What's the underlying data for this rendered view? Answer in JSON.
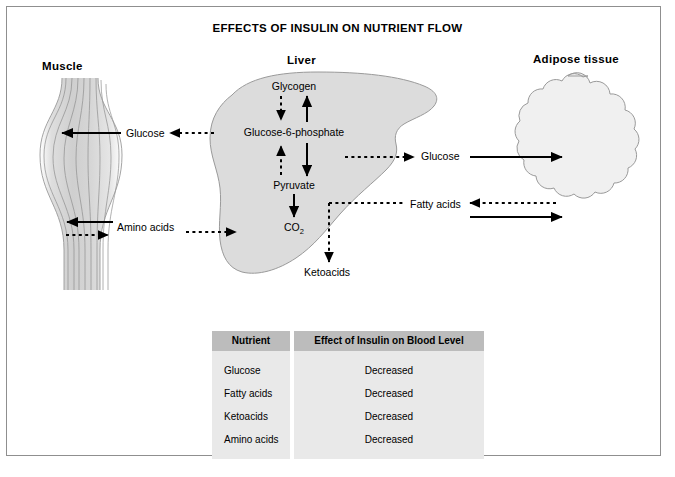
{
  "figure": {
    "title": "EFFECTS OF INSULIN ON NUTRIENT FLOW"
  },
  "organs": {
    "muscle": {
      "title": "Muscle",
      "icon": "muscle-fiber-shape"
    },
    "liver": {
      "title": "Liver",
      "icon": "liver-lobe-shape"
    },
    "adipose": {
      "title": "Adipose tissue",
      "icon": "adipocyte-cluster-shape"
    }
  },
  "liver_pathway": {
    "nodes": {
      "glycogen": "Glycogen",
      "glucose_6_phosphate": "Glucose-6-phosphate",
      "pyruvate": "Pyruvate",
      "co2_main": "CO",
      "co2_sub": "2",
      "ketoacids": "Ketoacids"
    },
    "steps": [
      {
        "from": "Glycogen",
        "to": "Glucose-6-phosphate",
        "style": "dashed",
        "direction": "down",
        "meaning": "glycogenolysis-inhibited"
      },
      {
        "from": "Glucose-6-phosphate",
        "to": "Glycogen",
        "style": "solid",
        "direction": "up",
        "meaning": "glycogenesis-stimulated"
      },
      {
        "from": "Pyruvate",
        "to": "Glucose-6-phosphate",
        "style": "dashed",
        "direction": "up",
        "meaning": "gluconeogenesis-inhibited"
      },
      {
        "from": "Glucose-6-phosphate",
        "to": "Pyruvate",
        "style": "solid",
        "direction": "down",
        "meaning": "glycolysis-stimulated"
      },
      {
        "from": "Pyruvate",
        "to": "CO2",
        "style": "solid",
        "direction": "down",
        "meaning": "oxidation-stimulated"
      },
      {
        "from": "Fatty acids",
        "to": "Ketoacids",
        "style": "dashed",
        "direction": "down",
        "meaning": "ketogenesis-inhibited"
      }
    ]
  },
  "transport_labels": {
    "glucose_muscle": "Glucose",
    "amino_acids": "Amino acids",
    "glucose_adipose": "Glucose",
    "fatty_acids": "Fatty acids"
  },
  "flows": [
    {
      "nutrient": "Glucose",
      "between": "liver-to-muscle",
      "solid": "uptake-into-muscle",
      "dashed": "output-from-liver-inhibited"
    },
    {
      "nutrient": "Amino acids",
      "between": "muscle-and-liver",
      "solid": "uptake-into-muscle",
      "dashed": "release-from-muscle-to-liver-inhibited"
    },
    {
      "nutrient": "Glucose",
      "between": "liver-to-adipose",
      "solid": "uptake-into-adipose",
      "dashed": "output-from-liver-inhibited"
    },
    {
      "nutrient": "Fatty acids",
      "between": "adipose-and-liver",
      "solid": "storage-into-adipose",
      "dashed": "release-from-adipose-inhibited"
    }
  ],
  "table": {
    "headers": [
      "Nutrient",
      "Effect of Insulin on Blood Level"
    ],
    "rows": [
      {
        "nutrient": "Glucose",
        "effect": "Decreased"
      },
      {
        "nutrient": "Fatty acids",
        "effect": "Decreased"
      },
      {
        "nutrient": "Ketoacids",
        "effect": "Decreased"
      },
      {
        "nutrient": "Amino acids",
        "effect": "Decreased"
      }
    ]
  },
  "colors": {
    "organ_fill": "#dcdcdc",
    "adipose_fill": "#f0f0f0",
    "outline": "#8f8f8f",
    "arrow": "#000000",
    "table_header_bg": "#bcbcbc",
    "table_body_bg": "#e9e9e9",
    "frame_border": "#8f8f8f"
  }
}
